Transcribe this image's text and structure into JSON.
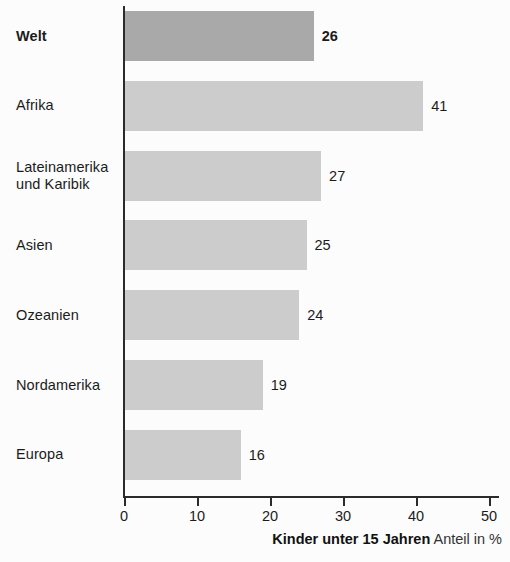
{
  "chart_data": {
    "type": "bar",
    "orientation": "horizontal",
    "title": "",
    "subtitle": "",
    "xlabel": "Kinder unter 15 Jahren Anteil in %",
    "ylabel": "",
    "xlim": [
      0,
      50
    ],
    "xticks": [
      0,
      10,
      20,
      30,
      40,
      50
    ],
    "xtick_labels": [
      "0",
      "10",
      "20",
      "30",
      "40",
      "50"
    ],
    "grid": false,
    "legend": false,
    "categories": [
      "Welt",
      "Afrika",
      "Lateinamerika und Karibik",
      "Asien",
      "Ozeanien",
      "Nordamerika",
      "Europa"
    ],
    "values": [
      26,
      41,
      27,
      25,
      24,
      19,
      16
    ],
    "value_labels": [
      "26",
      "41",
      "27",
      "25",
      "24",
      "19",
      "16"
    ],
    "highlight_index": 0,
    "colors": {
      "bar": "#cccccc",
      "bar_highlight": "#a9a9a9",
      "axis": "#2b2b2b",
      "text": "#1b1b1b",
      "background": "#fcfcfc"
    },
    "bars": [
      {
        "label": "Welt",
        "label_lines": [
          "Welt"
        ],
        "value": 26,
        "value_label": "26",
        "bold": true
      },
      {
        "label": "Afrika",
        "label_lines": [
          "Afrika"
        ],
        "value": 41,
        "value_label": "41",
        "bold": false
      },
      {
        "label": "Lateinamerika und Karibik",
        "label_lines": [
          "Lateinamerika",
          "und Karibik"
        ],
        "value": 27,
        "value_label": "27",
        "bold": false
      },
      {
        "label": "Asien",
        "label_lines": [
          "Asien"
        ],
        "value": 25,
        "value_label": "25",
        "bold": false
      },
      {
        "label": "Ozeanien",
        "label_lines": [
          "Ozeanien"
        ],
        "value": 24,
        "value_label": "24",
        "bold": false
      },
      {
        "label": "Nordamerika",
        "label_lines": [
          "Nordamerika"
        ],
        "value": 19,
        "value_label": "19",
        "bold": false
      },
      {
        "label": "Europa",
        "label_lines": [
          "Europa"
        ],
        "value": 16,
        "value_label": "16",
        "bold": false
      }
    ]
  },
  "caption": {
    "strong": "Kinder unter 15 Jahren",
    "normal": "Anteil in %"
  }
}
